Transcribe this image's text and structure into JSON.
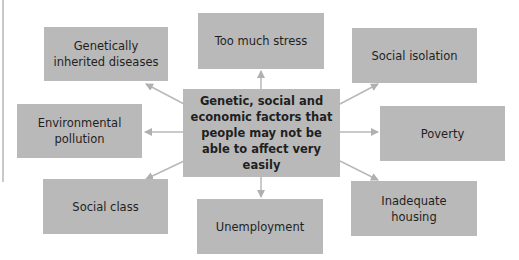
{
  "diagram": {
    "center": {
      "label": "Genetic, social and economic factors that people may not be able to affect very easily"
    },
    "nodes": [
      {
        "id": "too-much-stress",
        "label": "Too much stress"
      },
      {
        "id": "genetically-inherited-diseases",
        "label": "Genetically inherited diseases"
      },
      {
        "id": "social-isolation",
        "label": "Social isolation"
      },
      {
        "id": "environmental-pollution",
        "label": "Environmental pollution"
      },
      {
        "id": "poverty",
        "label": "Poverty"
      },
      {
        "id": "social-class",
        "label": "Social class"
      },
      {
        "id": "unemployment",
        "label": "Unemployment"
      },
      {
        "id": "inadequate-housing",
        "label": "Inadequate housing"
      }
    ],
    "colors": {
      "box": "#b9b9b9",
      "arrow": "#b0b0b0",
      "text": "#1f1f1f"
    }
  }
}
